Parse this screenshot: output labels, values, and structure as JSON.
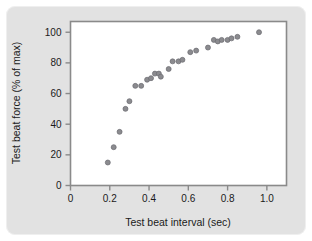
{
  "figure": {
    "background_color": "#e2e2e2",
    "plot_background_color": "#ffffff",
    "frame_color": "#8a8a8a",
    "marker_color": "#8b8b8f",
    "marker_edge_color": "#6a6a70"
  },
  "chart_data": {
    "type": "scatter",
    "title": "",
    "xlabel": "Test beat interval (sec)",
    "ylabel": "Test beat force (% of max)",
    "xlim": [
      0,
      1.1
    ],
    "ylim": [
      0,
      107
    ],
    "xticks": [
      0,
      0.2,
      0.4,
      0.6,
      0.8,
      1.0
    ],
    "xtick_labels": [
      "0",
      "0.2",
      "0.4",
      "0.6",
      "0.8",
      "1.0"
    ],
    "yticks": [
      0,
      20,
      40,
      60,
      80,
      100
    ],
    "ytick_labels": [
      "0",
      "20",
      "40",
      "60",
      "80",
      "100"
    ],
    "grid": false,
    "legend": false,
    "series": [
      {
        "name": "Test beat force",
        "points": [
          [
            0.19,
            15
          ],
          [
            0.22,
            25
          ],
          [
            0.25,
            35
          ],
          [
            0.28,
            50
          ],
          [
            0.3,
            55
          ],
          [
            0.33,
            65
          ],
          [
            0.36,
            65
          ],
          [
            0.39,
            69
          ],
          [
            0.41,
            70
          ],
          [
            0.43,
            73
          ],
          [
            0.45,
            73
          ],
          [
            0.46,
            71
          ],
          [
            0.5,
            76
          ],
          [
            0.52,
            81
          ],
          [
            0.55,
            81
          ],
          [
            0.57,
            82
          ],
          [
            0.61,
            87
          ],
          [
            0.64,
            88
          ],
          [
            0.7,
            90
          ],
          [
            0.73,
            95
          ],
          [
            0.75,
            94
          ],
          [
            0.77,
            95
          ],
          [
            0.8,
            95
          ],
          [
            0.82,
            96
          ],
          [
            0.85,
            97
          ],
          [
            0.96,
            100
          ]
        ]
      }
    ]
  }
}
